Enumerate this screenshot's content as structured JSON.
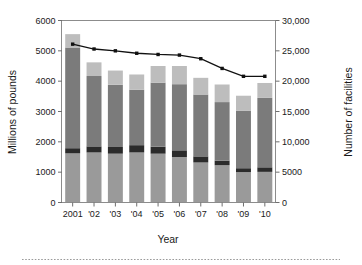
{
  "chart_data": {
    "type": "bar",
    "title": "",
    "subtitle": "",
    "xlabel": "Year",
    "ylabel": "Millions of pounds",
    "y2label": "Number of facilities",
    "grid": false,
    "legend_position": "none",
    "categories": [
      "2001",
      "'02",
      "'03",
      "'04",
      "'05",
      "'06",
      "'07",
      "'08",
      "'09",
      "'10"
    ],
    "xtick_labels": [
      "2001",
      "'02",
      "'03",
      "'04",
      "'05",
      "'06",
      "'07",
      "'08",
      "'09",
      "'10"
    ],
    "ytick_labels": [
      "0",
      "1000",
      "2000",
      "3000",
      "4000",
      "5000",
      "6000"
    ],
    "ytick_values": [
      0,
      1000,
      2000,
      3000,
      4000,
      5000,
      6000
    ],
    "ylim": [
      0,
      6000
    ],
    "y2tick_labels": [
      "0",
      "5000",
      "10,000",
      "15,000",
      "20,000",
      "25,000",
      "30,000"
    ],
    "y2tick_values": [
      0,
      5000,
      10000,
      15000,
      20000,
      25000,
      30000
    ],
    "y2lim": [
      0,
      30000
    ],
    "stacked": true,
    "series": [
      {
        "name": "segment-1-bottom",
        "color": "#9a9a9a",
        "axis": "left",
        "values": [
          1620,
          1650,
          1610,
          1650,
          1610,
          1500,
          1320,
          1230,
          1000,
          1010
        ]
      },
      {
        "name": "segment-2-dark",
        "color": "#2b2b2b",
        "axis": "left",
        "values": [
          170,
          200,
          220,
          240,
          230,
          220,
          200,
          150,
          130,
          150
        ]
      },
      {
        "name": "segment-3-mid",
        "color": "#7b7b7b",
        "axis": "left",
        "values": [
          3320,
          2320,
          2050,
          1830,
          2110,
          2180,
          2040,
          1930,
          1900,
          2290
        ]
      },
      {
        "name": "segment-4-top",
        "color": "#bdbdbd",
        "axis": "left",
        "values": [
          440,
          450,
          470,
          500,
          550,
          600,
          550,
          580,
          490,
          490
        ]
      }
    ],
    "bar_totals": [
      5550,
      4620,
      4350,
      4220,
      4500,
      4500,
      4110,
      3890,
      3520,
      3940
    ],
    "line_series": {
      "name": "Number of facilities",
      "axis": "right",
      "color": "#111111",
      "marker": "square",
      "values": [
        26100,
        25300,
        25000,
        24600,
        24400,
        24300,
        23700,
        22100,
        20800,
        20800
      ]
    }
  },
  "figure": {
    "separator": "dotted-rule"
  }
}
